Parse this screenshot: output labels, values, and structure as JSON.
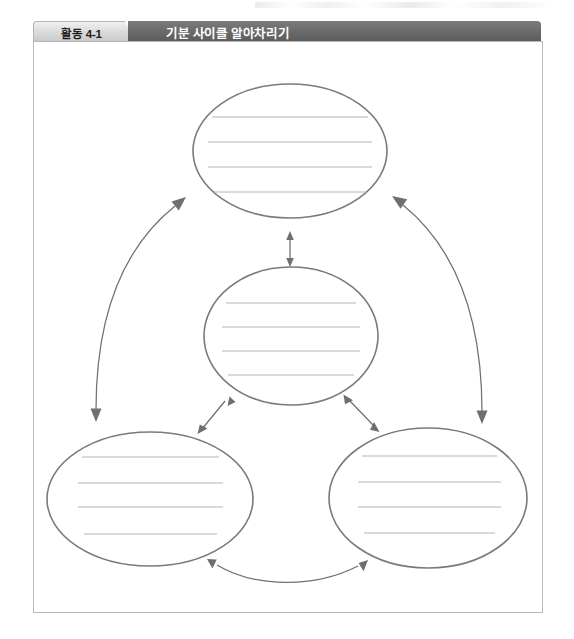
{
  "worksheet": {
    "activity_tab_label": "활동 4-1",
    "banner_title": "기분 사이클 알아차리기",
    "colors": {
      "banner_dark": "#6c6c6c",
      "tab_light": "#dcdcdc",
      "frame_border": "#b9b9bd",
      "ellipse_stroke": "#7a7a7e",
      "writing_line": "#b5b5b9",
      "arrow_stroke": "#6f6f73",
      "background": "#ffffff"
    }
  },
  "diagram": {
    "type": "cycle",
    "node_count": 4,
    "nodes": [
      {
        "id": "node-top",
        "label": "",
        "writing_lines": 4,
        "cx": 290,
        "cy": 151,
        "rx": 97,
        "ry": 67
      },
      {
        "id": "node-center",
        "label": "",
        "writing_lines": 4,
        "cx": 291,
        "cy": 336,
        "rx": 87,
        "ry": 69
      },
      {
        "id": "node-bottom-left",
        "label": "",
        "writing_lines": 4,
        "cx": 150,
        "cy": 499,
        "rx": 103,
        "ry": 67
      },
      {
        "id": "node-bottom-right",
        "label": "",
        "writing_lines": 4,
        "cx": 428,
        "cy": 498,
        "rx": 99,
        "ry": 70
      }
    ],
    "connectors": [
      {
        "id": "arrow-top-center",
        "from": "node-top",
        "to": "node-center",
        "style": "straight",
        "heads": "both"
      },
      {
        "id": "arrow-center-bottom-left",
        "from": "node-center",
        "to": "node-bottom-left",
        "style": "straight",
        "heads": "both"
      },
      {
        "id": "arrow-center-bottom-right",
        "from": "node-center",
        "to": "node-bottom-right",
        "style": "straight",
        "heads": "both"
      },
      {
        "id": "arrow-top-bottom-left",
        "from": "node-top",
        "to": "node-bottom-left",
        "style": "curved",
        "heads": "both"
      },
      {
        "id": "arrow-top-bottom-right",
        "from": "node-top",
        "to": "node-bottom-right",
        "style": "curved",
        "heads": "both"
      },
      {
        "id": "arrow-bottom-left-bottom-right",
        "from": "node-bottom-left",
        "to": "node-bottom-right",
        "style": "curved",
        "heads": "both"
      }
    ]
  }
}
